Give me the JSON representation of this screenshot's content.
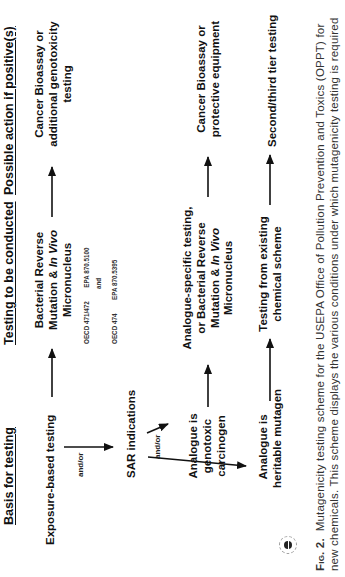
{
  "headers": {
    "basis": "Basis for testing",
    "testing": "Testing to be conducted",
    "action": "Possible action if positive(s)"
  },
  "basis": {
    "exposure": "Exposure-based testing",
    "and_or_1": "and/or",
    "sar": "SAR indications",
    "and_or_2": "and/or",
    "genotoxic": [
      "Analogue is",
      "genotoxic",
      "carcinogen"
    ],
    "heritable": [
      "Analogue is",
      "heritable mutagen"
    ]
  },
  "testing": {
    "row1": {
      "line1": "Bacterial Reverse",
      "line2_pre": "Mutation & ",
      "line2_italic": "In Vivo",
      "line3": "Micronucleus",
      "guidelines": {
        "a_left": "OECD 471/472",
        "a_right": "EPA 870.5100",
        "and": "and",
        "b_left": "OECD 474",
        "b_right": "EPA 870.5395"
      }
    },
    "row2": {
      "line1": "Analogue-specific testing,",
      "line2": "or Bacterial Reverse",
      "line3_pre": "Mutation & ",
      "line3_italic": "In Vivo",
      "line4": "Micronucleus"
    },
    "row3": [
      "Testing from existing",
      "chemical scheme"
    ]
  },
  "actions": {
    "row1": [
      "Cancer Bioassay or",
      "additional genotoxicity",
      "testing"
    ],
    "row2": [
      "Cancer Bioassay or",
      "protective equipment"
    ],
    "row3": "Second/third tier testing"
  },
  "caption": {
    "label": "Fig. 2.",
    "line1": "Mutagenicity testing scheme for the USEPA Office of Pollution Prevention and Toxics (OPPT) for",
    "line2": "new chemicals. This scheme displays the various conditions under which mutagenicity testing is required"
  },
  "icons": {
    "logo": "publisher-logo-icon"
  },
  "colors": {
    "text": "#111111",
    "caption": "#333333",
    "arrow": "#111111"
  }
}
